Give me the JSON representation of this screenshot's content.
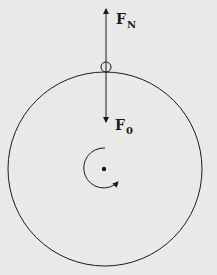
{
  "diagram": {
    "type": "force-diagram",
    "colors": {
      "background": "#e9e9e7",
      "ink": "#1a1a1a"
    },
    "labels": {
      "normal_force": {
        "main": "F",
        "sub": "N"
      },
      "weight_force": {
        "main": "F",
        "sub": "0"
      }
    },
    "elements": {
      "large_circle": "rotating-disk",
      "small_circle": "object-on-rim",
      "center_dot": "axis",
      "rotation_arrow": "counterclockwise-rotation"
    }
  }
}
